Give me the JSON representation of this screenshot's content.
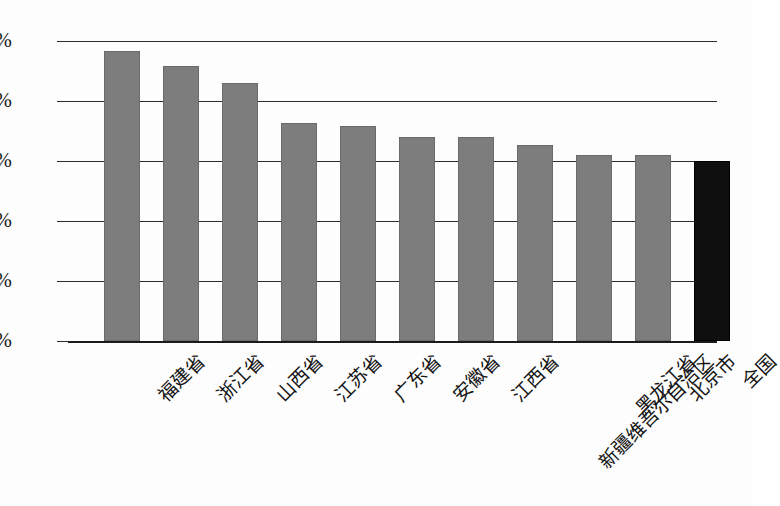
{
  "chart_data": {
    "type": "bar",
    "title": "",
    "xlabel": "",
    "ylabel": "",
    "categories": [
      "福建省",
      "浙江省",
      "山西省",
      "江苏省",
      "广东省",
      "安徽省",
      "江西省",
      "新疆维吾尔自治区",
      "黑龙江省",
      "北京市",
      "全国"
    ],
    "values": [
      2.42,
      2.29,
      2.15,
      1.82,
      1.79,
      1.7,
      1.7,
      1.63,
      1.55,
      1.55,
      1.5
    ],
    "value_unit": "%",
    "ylim": [
      0.0,
      2.5
    ],
    "ytick_labels": [
      "2.50%",
      "2.00%",
      "1.50%",
      "1.00%",
      "0.50%",
      "0.00%"
    ],
    "ytick_values": [
      2.5,
      2.0,
      1.5,
      1.0,
      0.5,
      0.0
    ],
    "grid": true,
    "legend": "none",
    "bar_colors": [
      "#7d7d7d",
      "#7d7d7d",
      "#7d7d7d",
      "#7d7d7d",
      "#7d7d7d",
      "#7d7d7d",
      "#7d7d7d",
      "#7d7d7d",
      "#7d7d7d",
      "#7d7d7d",
      "#0b0b0b"
    ],
    "highlight_index": 10,
    "colors": {
      "bar_fill": "#7d7d7d",
      "bar_highlight": "#0b0b0b",
      "axis": "#1b1b1b",
      "gridline": "#2b2b2b",
      "background": "#fdfdfd",
      "text": "#161616"
    }
  }
}
